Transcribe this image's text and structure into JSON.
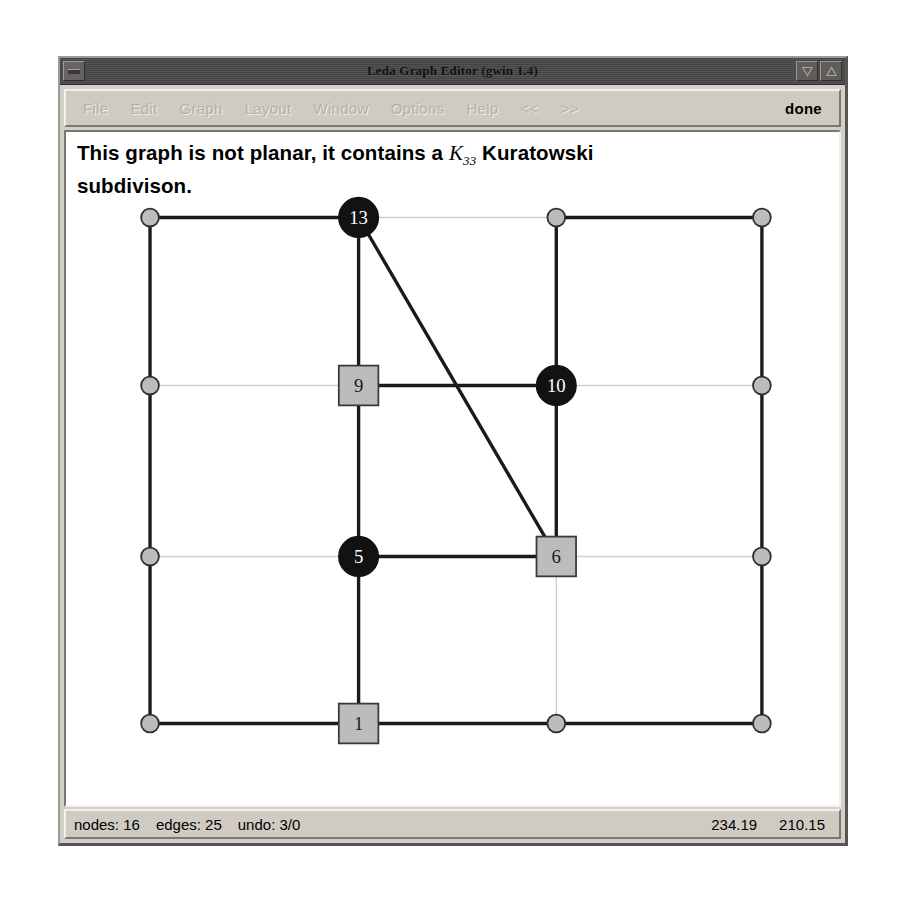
{
  "window": {
    "title": "Leda Graph Editor  (gwin 1.4)",
    "system_menu_icon": "window-menu-icon",
    "minimize_icon": "minimize-icon",
    "maximize_icon": "maximize-icon"
  },
  "menubar": {
    "items": [
      {
        "label": "File",
        "enabled": false
      },
      {
        "label": "Edit",
        "enabled": false
      },
      {
        "label": "Graph",
        "enabled": false
      },
      {
        "label": "Layout",
        "enabled": false
      },
      {
        "label": "Window",
        "enabled": false
      },
      {
        "label": "Options",
        "enabled": false
      },
      {
        "label": "Help",
        "enabled": false
      },
      {
        "label": "<<",
        "enabled": false
      },
      {
        "label": ">>",
        "enabled": false
      }
    ],
    "done_label": "done"
  },
  "canvas": {
    "message_line1_pre": "This graph is not planar, it contains a",
    "message_k": "K",
    "message_k_sub": "33",
    "message_line1_post": "Kuratowski",
    "message_line2": "subdivison."
  },
  "statusbar": {
    "nodes_label": "nodes: 16",
    "edges_label": "edges: 25",
    "undo_label": "undo: 3/0",
    "coord_x": "234.19",
    "coord_y": "210.15"
  },
  "colors": {
    "window_face": "#d4d0c8",
    "titlebar": "#4a4a4a",
    "canvas_bg": "#ffffff",
    "node_black": "#121212",
    "node_gray": "#bcbcbc",
    "edge_dark": "#1a1a1a",
    "edge_light": "#cfcfcf"
  },
  "chart_data": {
    "type": "diagram",
    "columns_x": [
      145,
      356,
      556,
      764
    ],
    "rows_y": [
      231,
      400,
      572,
      740
    ],
    "nodes": [
      {
        "id": "n00",
        "label": "",
        "shape": "circle",
        "fill": "gray",
        "x": 145,
        "y": 231,
        "r": 9
      },
      {
        "id": "n10",
        "label": "13",
        "shape": "circle",
        "fill": "black",
        "x": 356,
        "y": 231,
        "r": 20
      },
      {
        "id": "n20",
        "label": "",
        "shape": "circle",
        "fill": "gray",
        "x": 556,
        "y": 231,
        "r": 9
      },
      {
        "id": "n30",
        "label": "",
        "shape": "circle",
        "fill": "gray",
        "x": 764,
        "y": 231,
        "r": 9
      },
      {
        "id": "n01",
        "label": "",
        "shape": "circle",
        "fill": "gray",
        "x": 145,
        "y": 400,
        "r": 9
      },
      {
        "id": "n11",
        "label": "9",
        "shape": "square",
        "fill": "gray",
        "x": 356,
        "y": 400,
        "r": 20
      },
      {
        "id": "n21",
        "label": "10",
        "shape": "circle",
        "fill": "black",
        "x": 556,
        "y": 400,
        "r": 20
      },
      {
        "id": "n31",
        "label": "",
        "shape": "circle",
        "fill": "gray",
        "x": 764,
        "y": 400,
        "r": 9
      },
      {
        "id": "n02",
        "label": "",
        "shape": "circle",
        "fill": "gray",
        "x": 145,
        "y": 572,
        "r": 9
      },
      {
        "id": "n12",
        "label": "5",
        "shape": "circle",
        "fill": "black",
        "x": 356,
        "y": 572,
        "r": 20
      },
      {
        "id": "n22",
        "label": "6",
        "shape": "square",
        "fill": "gray",
        "x": 556,
        "y": 572,
        "r": 20
      },
      {
        "id": "n32",
        "label": "",
        "shape": "circle",
        "fill": "gray",
        "x": 764,
        "y": 572,
        "r": 9
      },
      {
        "id": "n03",
        "label": "",
        "shape": "circle",
        "fill": "gray",
        "x": 145,
        "y": 740,
        "r": 9
      },
      {
        "id": "n13",
        "label": "1",
        "shape": "square",
        "fill": "gray",
        "x": 356,
        "y": 740,
        "r": 20
      },
      {
        "id": "n23",
        "label": "",
        "shape": "circle",
        "fill": "gray",
        "x": 556,
        "y": 740,
        "r": 9
      },
      {
        "id": "n33",
        "label": "",
        "shape": "circle",
        "fill": "gray",
        "x": 764,
        "y": 740,
        "r": 9
      }
    ],
    "edges": [
      {
        "from": "n00",
        "to": "n10",
        "style": "dark"
      },
      {
        "from": "n10",
        "to": "n20",
        "style": "light"
      },
      {
        "from": "n20",
        "to": "n30",
        "style": "dark"
      },
      {
        "from": "n01",
        "to": "n11",
        "style": "light"
      },
      {
        "from": "n11",
        "to": "n21",
        "style": "dark"
      },
      {
        "from": "n21",
        "to": "n31",
        "style": "light"
      },
      {
        "from": "n02",
        "to": "n12",
        "style": "light"
      },
      {
        "from": "n12",
        "to": "n22",
        "style": "dark"
      },
      {
        "from": "n22",
        "to": "n32",
        "style": "light"
      },
      {
        "from": "n03",
        "to": "n13",
        "style": "dark"
      },
      {
        "from": "n13",
        "to": "n23",
        "style": "dark"
      },
      {
        "from": "n23",
        "to": "n33",
        "style": "dark"
      },
      {
        "from": "n00",
        "to": "n01",
        "style": "dark"
      },
      {
        "from": "n01",
        "to": "n02",
        "style": "dark"
      },
      {
        "from": "n02",
        "to": "n03",
        "style": "dark"
      },
      {
        "from": "n10",
        "to": "n11",
        "style": "dark"
      },
      {
        "from": "n11",
        "to": "n12",
        "style": "dark"
      },
      {
        "from": "n12",
        "to": "n13",
        "style": "dark"
      },
      {
        "from": "n20",
        "to": "n21",
        "style": "dark"
      },
      {
        "from": "n21",
        "to": "n22",
        "style": "dark"
      },
      {
        "from": "n22",
        "to": "n23",
        "style": "light"
      },
      {
        "from": "n30",
        "to": "n31",
        "style": "dark"
      },
      {
        "from": "n31",
        "to": "n32",
        "style": "dark"
      },
      {
        "from": "n32",
        "to": "n33",
        "style": "dark"
      },
      {
        "from": "n10",
        "to": "n22",
        "style": "dark"
      }
    ]
  }
}
